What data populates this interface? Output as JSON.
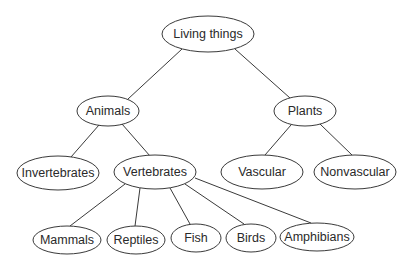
{
  "diagram": {
    "type": "tree",
    "title": "",
    "colors": {
      "stroke": "#3a3a3a",
      "text": "#2a2a2a",
      "background": "#ffffff"
    },
    "nodes": [
      {
        "id": "living",
        "label": "Living things",
        "cx": 208,
        "cy": 34,
        "rx": 46,
        "ry": 18
      },
      {
        "id": "animals",
        "label": "Animals",
        "cx": 108,
        "cy": 111,
        "rx": 31,
        "ry": 15
      },
      {
        "id": "plants",
        "label": "Plants",
        "cx": 305,
        "cy": 111,
        "rx": 31,
        "ry": 15
      },
      {
        "id": "invertebrates",
        "label": "Invertebrates",
        "cx": 58,
        "cy": 173,
        "rx": 41,
        "ry": 17
      },
      {
        "id": "vertebrates",
        "label": "Vertebrates",
        "cx": 155,
        "cy": 172,
        "rx": 41,
        "ry": 17
      },
      {
        "id": "vascular",
        "label": "Vascular",
        "cx": 262,
        "cy": 172,
        "rx": 41,
        "ry": 17
      },
      {
        "id": "nonvascular",
        "label": "Nonvascular",
        "cx": 355,
        "cy": 172,
        "rx": 41,
        "ry": 17
      },
      {
        "id": "mammals",
        "label": "Mammals",
        "cx": 67,
        "cy": 240,
        "rx": 34,
        "ry": 14
      },
      {
        "id": "reptiles",
        "label": "Reptiles",
        "cx": 136,
        "cy": 240,
        "rx": 29,
        "ry": 14
      },
      {
        "id": "fish",
        "label": "Fish",
        "cx": 196,
        "cy": 238,
        "rx": 25,
        "ry": 14
      },
      {
        "id": "birds",
        "label": "Birds",
        "cx": 251,
        "cy": 238,
        "rx": 25,
        "ry": 14
      },
      {
        "id": "amphibians",
        "label": "Amphibians",
        "cx": 317,
        "cy": 237,
        "rx": 37,
        "ry": 14
      }
    ],
    "edges": [
      {
        "from": "living",
        "to": "animals",
        "x1": 182,
        "y1": 49,
        "x2": 128,
        "y2": 99
      },
      {
        "from": "living",
        "to": "plants",
        "x1": 235,
        "y1": 49,
        "x2": 290,
        "y2": 98
      },
      {
        "from": "animals",
        "to": "invertebrates",
        "x1": 99,
        "y1": 125,
        "x2": 71,
        "y2": 157
      },
      {
        "from": "animals",
        "to": "vertebrates",
        "x1": 122,
        "y1": 124,
        "x2": 150,
        "y2": 156
      },
      {
        "from": "plants",
        "to": "vascular",
        "x1": 291,
        "y1": 125,
        "x2": 265,
        "y2": 155
      },
      {
        "from": "plants",
        "to": "nonvascular",
        "x1": 320,
        "y1": 124,
        "x2": 352,
        "y2": 155
      },
      {
        "from": "vertebrates",
        "to": "mammals",
        "x1": 125,
        "y1": 184,
        "x2": 70,
        "y2": 226
      },
      {
        "from": "vertebrates",
        "to": "reptiles",
        "x1": 140,
        "y1": 188,
        "x2": 135,
        "y2": 226
      },
      {
        "from": "vertebrates",
        "to": "fish",
        "x1": 170,
        "y1": 188,
        "x2": 190,
        "y2": 224
      },
      {
        "from": "vertebrates",
        "to": "birds",
        "x1": 185,
        "y1": 184,
        "x2": 244,
        "y2": 224
      },
      {
        "from": "vertebrates",
        "to": "amphibians",
        "x1": 195,
        "y1": 178,
        "x2": 311,
        "y2": 223
      }
    ]
  }
}
